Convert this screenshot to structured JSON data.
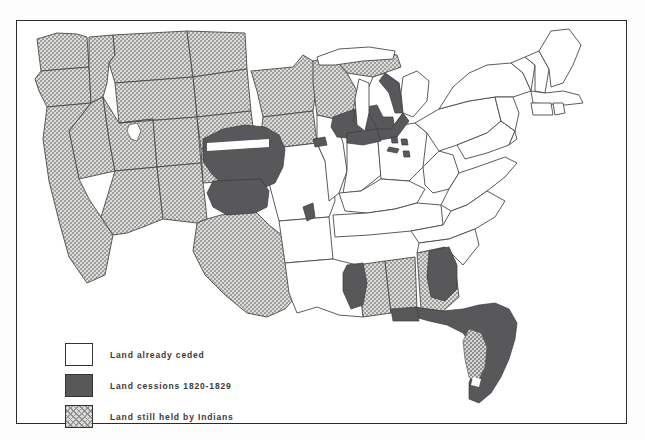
{
  "figure": {
    "type": "thematic-map",
    "frame": {
      "border_color": "#2b2b2b"
    },
    "background_color": "#ffffff"
  },
  "legend": {
    "items": [
      {
        "key": "ceded",
        "label": "Land already ceded",
        "swatch": "white-square",
        "color": "#ffffff",
        "pattern": "none"
      },
      {
        "key": "cession",
        "label": "Land cessions 1820-1829",
        "swatch": "dark-square",
        "color": "#58585a",
        "pattern": "solid"
      },
      {
        "key": "held",
        "label": "Land still held by Indians",
        "swatch": "hatched-square",
        "color": "#c9c9c7",
        "pattern": "cross-hatch"
      }
    ]
  },
  "map": {
    "regions_held_by_indians": [
      "Washington",
      "Oregon",
      "California",
      "Nevada",
      "Idaho",
      "Montana",
      "Wyoming",
      "Utah",
      "Colorado",
      "Arizona",
      "New Mexico",
      "Texas",
      "North Dakota",
      "South Dakota",
      "Nebraska",
      "Kansas",
      "Minnesota",
      "Wisconsin",
      "Iowa",
      "Michigan Upper Peninsula",
      "Mississippi",
      "Alabama",
      "Georgia",
      "Florida interior"
    ],
    "regions_cession_1820_1829": [
      "Wisconsin southern",
      "Illinois northern",
      "Michigan southern",
      "Indiana northern",
      "Ohio reservations",
      "Kansas eastern",
      "Nebraska eastern",
      "Oklahoma",
      "Missouri wedge",
      "Arkansas northwest",
      "Alabama western",
      "Georgia western",
      "Florida"
    ],
    "regions_already_ceded": [
      "Maine",
      "New Hampshire",
      "Vermont",
      "Massachusetts",
      "Rhode Island",
      "Connecticut",
      "New York",
      "Pennsylvania",
      "New Jersey",
      "Delaware",
      "Maryland",
      "Virginia",
      "West Virginia",
      "North Carolina",
      "South Carolina",
      "Ohio",
      "Kentucky",
      "Tennessee",
      "Indiana",
      "Illinois",
      "Missouri",
      "Arkansas",
      "Louisiana"
    ]
  }
}
